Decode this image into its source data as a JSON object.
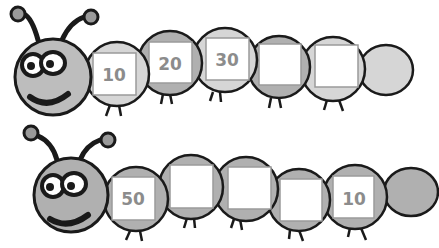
{
  "colors": {
    "outline": "#1a1a1a",
    "light_fill": "#d6d6d6",
    "dark_fill": "#b0b0b0",
    "head_fill": "#bdbdbd",
    "box_fill": "#ffffff",
    "box_stroke": "#9a9a9a",
    "number_color": "#8c8c8c"
  },
  "caterpillars": [
    {
      "name": "top",
      "segments": [
        {
          "value": "10",
          "fill": "light"
        },
        {
          "value": "20",
          "fill": "dark"
        },
        {
          "value": "30",
          "fill": "light"
        },
        {
          "value": "",
          "fill": "dark"
        },
        {
          "value": "",
          "fill": "light"
        }
      ]
    },
    {
      "name": "bottom",
      "segments": [
        {
          "value": "50",
          "fill": "dark"
        },
        {
          "value": "",
          "fill": "dark"
        },
        {
          "value": "",
          "fill": "dark"
        },
        {
          "value": "",
          "fill": "dark"
        },
        {
          "value": "10",
          "fill": "dark"
        }
      ]
    }
  ]
}
